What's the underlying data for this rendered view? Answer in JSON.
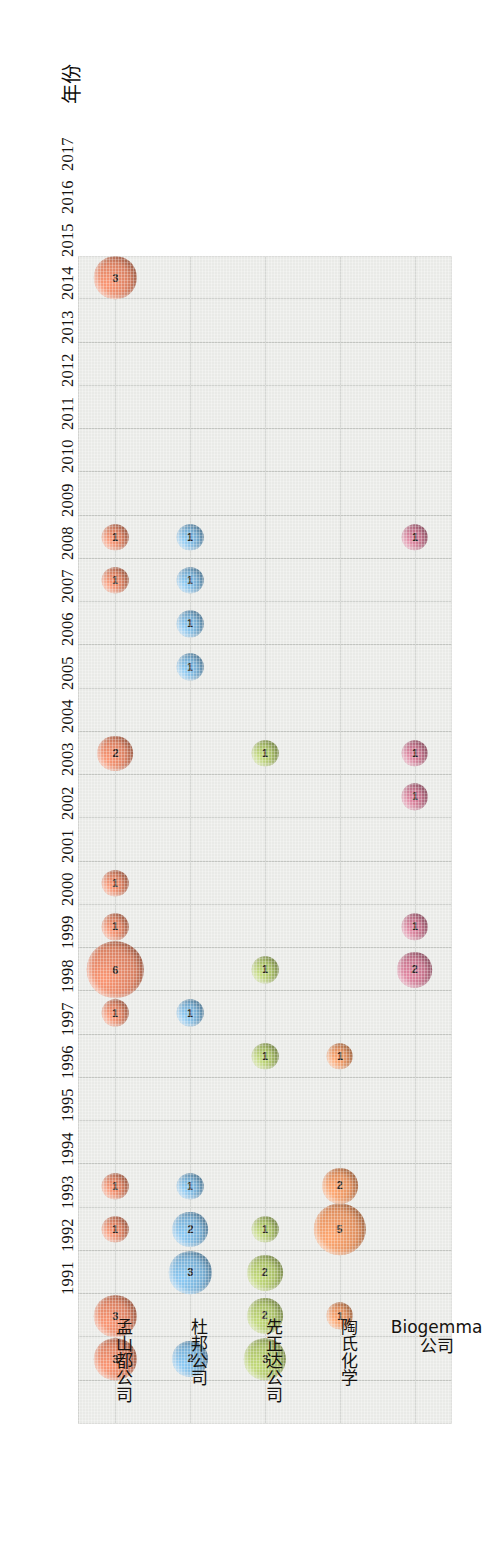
{
  "axis_title": "年份",
  "years": [
    2017,
    2016,
    2015,
    2014,
    2013,
    2012,
    2011,
    2010,
    2009,
    2008,
    2007,
    2006,
    2005,
    2004,
    2003,
    2002,
    2001,
    2000,
    1999,
    1998,
    1997,
    1996,
    1995,
    1994,
    1993,
    1992,
    1991
  ],
  "companies": [
    {
      "id": "monsanto",
      "label": "孟山都公司",
      "color": "#d98264"
    },
    {
      "id": "dupont",
      "label": "杜邦公司",
      "color": "#79aed2"
    },
    {
      "id": "syngenta",
      "label": "先正达公司",
      "color": "#a8bd69"
    },
    {
      "id": "dow",
      "label": "陶氏化学",
      "color": "#e09161"
    },
    {
      "id": "biogemma",
      "label": "Biogemma 公司",
      "color": "#c3748c"
    }
  ],
  "colors": {
    "plot_background": "#e9eae7",
    "gridline": "#c3c5c1",
    "page_background": "#ffffff",
    "monsanto": "#d98264",
    "dupont": "#79aed2",
    "syngenta": "#a8bd69",
    "dow": "#e09161",
    "biogemma": "#c3748c"
  },
  "chart_data": {
    "type": "scatter",
    "title": "",
    "xlabel": "",
    "ylabel": "年份",
    "orientation": "rotated-90",
    "grid": true,
    "legend": "none",
    "size_encoding": "bubble area proportional to value; value printed inside bubble",
    "categories": [
      "孟山都公司",
      "杜邦公司",
      "先正达公司",
      "陶氏化学",
      "Biogemma 公司"
    ],
    "y": [
      2017,
      2016,
      2015,
      2014,
      2013,
      2012,
      2011,
      2010,
      2009,
      2008,
      2007,
      2006,
      2005,
      2004,
      2003,
      2002,
      2001,
      2000,
      1999,
      1998,
      1997,
      1996,
      1995,
      1994,
      1993,
      1992,
      1991
    ],
    "ylim": [
      1991,
      2017
    ],
    "series": [
      {
        "name": "孟山都公司",
        "color": "#d98264",
        "points": [
          {
            "year": 2016,
            "value": 3
          },
          {
            "year": 2015,
            "value": 3
          },
          {
            "year": 2013,
            "value": 1
          },
          {
            "year": 2012,
            "value": 1
          },
          {
            "year": 2008,
            "value": 1
          },
          {
            "year": 2007,
            "value": 6
          },
          {
            "year": 2006,
            "value": 1
          },
          {
            "year": 2005,
            "value": 1
          },
          {
            "year": 2002,
            "value": 2
          },
          {
            "year": 1998,
            "value": 1
          },
          {
            "year": 1997,
            "value": 1
          },
          {
            "year": 1991,
            "value": 3
          }
        ]
      },
      {
        "name": "杜邦公司",
        "color": "#79aed2",
        "points": [
          {
            "year": 2016,
            "value": 2
          },
          {
            "year": 2014,
            "value": 3
          },
          {
            "year": 2013,
            "value": 2
          },
          {
            "year": 2012,
            "value": 1
          },
          {
            "year": 2008,
            "value": 1
          },
          {
            "year": 2000,
            "value": 1
          },
          {
            "year": 1999,
            "value": 1
          },
          {
            "year": 1998,
            "value": 1
          },
          {
            "year": 1997,
            "value": 1
          }
        ]
      },
      {
        "name": "先正达公司",
        "color": "#a8bd69",
        "points": [
          {
            "year": 2016,
            "value": 3
          },
          {
            "year": 2015,
            "value": 2
          },
          {
            "year": 2014,
            "value": 2
          },
          {
            "year": 2013,
            "value": 1
          },
          {
            "year": 2009,
            "value": 1
          },
          {
            "year": 2007,
            "value": 1
          },
          {
            "year": 2002,
            "value": 1
          }
        ]
      },
      {
        "name": "陶氏化学",
        "color": "#e09161",
        "points": [
          {
            "year": 2015,
            "value": 1
          },
          {
            "year": 2013,
            "value": 5
          },
          {
            "year": 2012,
            "value": 2
          },
          {
            "year": 2009,
            "value": 1
          }
        ]
      },
      {
        "name": "Biogemma 公司",
        "color": "#c3748c",
        "points": [
          {
            "year": 2007,
            "value": 2
          },
          {
            "year": 2006,
            "value": 1
          },
          {
            "year": 2003,
            "value": 1
          },
          {
            "year": 2002,
            "value": 1
          },
          {
            "year": 1997,
            "value": 1
          }
        ]
      }
    ]
  }
}
